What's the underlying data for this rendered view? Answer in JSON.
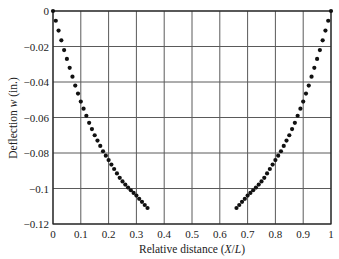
{
  "chart_data": {
    "type": "scatter",
    "title": "",
    "xlabel": "Relative distance (X/L)",
    "ylabel": "Deflection w (in.)",
    "xlim": [
      0,
      1
    ],
    "ylim": [
      -0.12,
      0
    ],
    "grid": true,
    "legend": null,
    "x_ticks": [
      "0",
      "0.1",
      "0.2",
      "0.3",
      "0.4",
      "0.5",
      "0.6",
      "0.7",
      "0.8",
      "0.9",
      "1"
    ],
    "y_ticks": [
      "0",
      "-0.02",
      "-0.04",
      "-0.06",
      "-0.08",
      "-0.1",
      "-0.12"
    ],
    "series": [
      {
        "name": "left branch",
        "x": [
          0.0,
          0.01,
          0.02,
          0.03,
          0.04,
          0.05,
          0.06,
          0.07,
          0.08,
          0.09,
          0.1,
          0.11,
          0.12,
          0.13,
          0.14,
          0.15,
          0.16,
          0.17,
          0.18,
          0.19,
          0.2,
          0.21,
          0.22,
          0.23,
          0.24,
          0.25,
          0.26,
          0.27,
          0.28,
          0.29,
          0.3,
          0.31,
          0.32,
          0.33,
          0.34
        ],
        "y": [
          0.0,
          -0.0055,
          -0.011,
          -0.0165,
          -0.022,
          -0.027,
          -0.032,
          -0.037,
          -0.042,
          -0.0465,
          -0.051,
          -0.055,
          -0.059,
          -0.063,
          -0.0665,
          -0.07,
          -0.073,
          -0.076,
          -0.079,
          -0.0815,
          -0.084,
          -0.0865,
          -0.089,
          -0.0915,
          -0.094,
          -0.096,
          -0.0978,
          -0.0995,
          -0.101,
          -0.1025,
          -0.104,
          -0.1058,
          -0.1075,
          -0.1093,
          -0.111
        ]
      },
      {
        "name": "right branch",
        "x": [
          0.66,
          0.67,
          0.68,
          0.69,
          0.7,
          0.71,
          0.72,
          0.73,
          0.74,
          0.75,
          0.76,
          0.77,
          0.78,
          0.79,
          0.8,
          0.81,
          0.82,
          0.83,
          0.84,
          0.85,
          0.86,
          0.87,
          0.88,
          0.89,
          0.9,
          0.91,
          0.92,
          0.93,
          0.94,
          0.95,
          0.96,
          0.97,
          0.98,
          0.99,
          1.0
        ],
        "y": [
          -0.111,
          -0.1093,
          -0.1075,
          -0.1058,
          -0.104,
          -0.1025,
          -0.101,
          -0.0995,
          -0.0978,
          -0.096,
          -0.094,
          -0.0915,
          -0.089,
          -0.0865,
          -0.084,
          -0.0815,
          -0.079,
          -0.076,
          -0.073,
          -0.07,
          -0.0665,
          -0.063,
          -0.059,
          -0.055,
          -0.051,
          -0.0465,
          -0.042,
          -0.037,
          -0.032,
          -0.027,
          -0.022,
          -0.0165,
          -0.011,
          -0.0055,
          0.0
        ]
      }
    ]
  },
  "style": {
    "grid_color": "#5a5a5a",
    "axis_color": "#222222",
    "marker_color": "#111111"
  },
  "axes": {
    "xlabel_main": "Relative distance (",
    "xlabel_italic": "X",
    "xlabel_slash": "/",
    "xlabel_italic2": "L",
    "xlabel_end": ")",
    "ylabel_main": "Deflection ",
    "ylabel_italic": "w",
    "ylabel_end": " (in.)"
  }
}
